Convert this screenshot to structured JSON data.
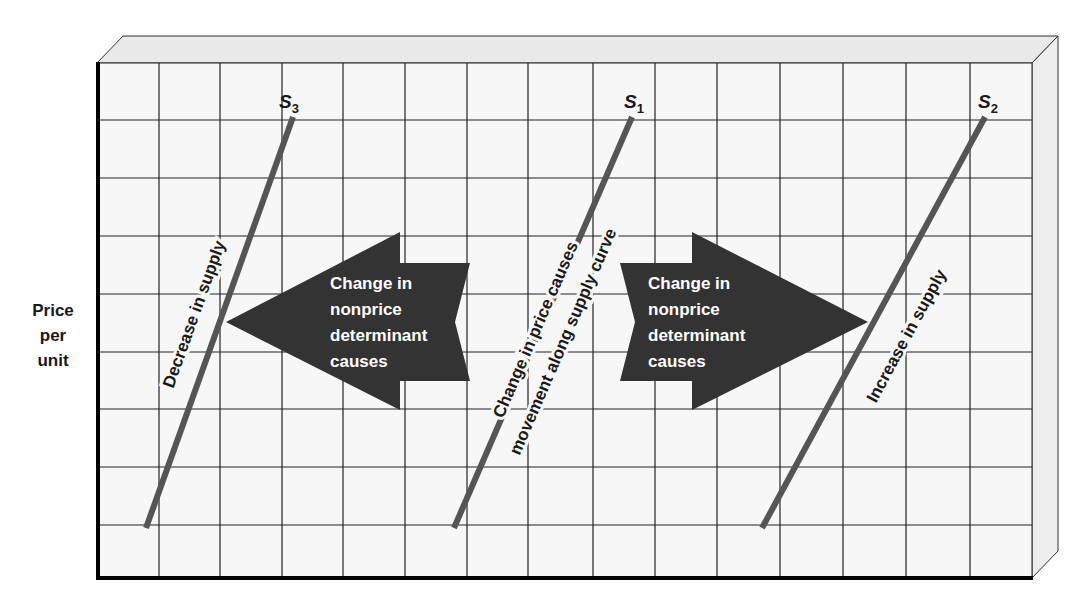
{
  "diagram": {
    "y_axis_label": [
      "Price",
      "per",
      "unit"
    ],
    "curves": [
      {
        "id": "S3",
        "letter": "S",
        "subscript": "3",
        "annotation": "Decrease in supply"
      },
      {
        "id": "S1",
        "letter": "S",
        "subscript": "1",
        "annotation_line1": "Change in price causes",
        "annotation_line2": "movement along supply curve"
      },
      {
        "id": "S2",
        "letter": "S",
        "subscript": "2",
        "annotation": "Increase in supply"
      }
    ],
    "left_arrow": {
      "direction": "left",
      "lines": [
        "Change in",
        "nonprice",
        "determinant",
        "causes"
      ]
    },
    "right_arrow": {
      "direction": "right",
      "lines": [
        "Change in",
        "nonprice",
        "determinant",
        "causes"
      ]
    },
    "colors": {
      "grid": "#2a2a2a",
      "curve": "#555555",
      "arrow": "#333333",
      "face": "#f6f6f6",
      "depth": "#e6e6e6"
    }
  }
}
